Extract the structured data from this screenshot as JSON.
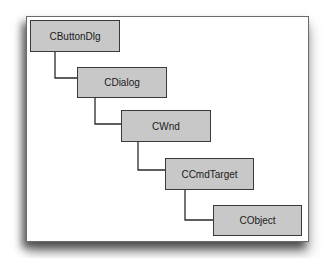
{
  "diagram": {
    "type": "class-hierarchy",
    "colors": {
      "box_fill": "#c8c8c8",
      "box_border": "#3a3a3a",
      "line": "#2a2a2a",
      "panel": "#ffffff"
    },
    "nodes": [
      {
        "id": "n0",
        "label": "CButtonDlg",
        "x": 30,
        "y": 20,
        "w": 90,
        "h": 32
      },
      {
        "id": "n1",
        "label": "CDialog",
        "x": 77,
        "y": 67,
        "w": 90,
        "h": 31
      },
      {
        "id": "n2",
        "label": "CWnd",
        "x": 121,
        "y": 110,
        "w": 90,
        "h": 32
      },
      {
        "id": "n3",
        "label": "CCmdTarget",
        "x": 165,
        "y": 158,
        "w": 89,
        "h": 32
      },
      {
        "id": "n4",
        "label": "CObject",
        "x": 213,
        "y": 205,
        "w": 89,
        "h": 31
      }
    ],
    "edges": [
      {
        "from": "CButtonDlg",
        "to": "CDialog"
      },
      {
        "from": "CDialog",
        "to": "CWnd"
      },
      {
        "from": "CWnd",
        "to": "CCmdTarget"
      },
      {
        "from": "CCmdTarget",
        "to": "CObject"
      }
    ]
  }
}
